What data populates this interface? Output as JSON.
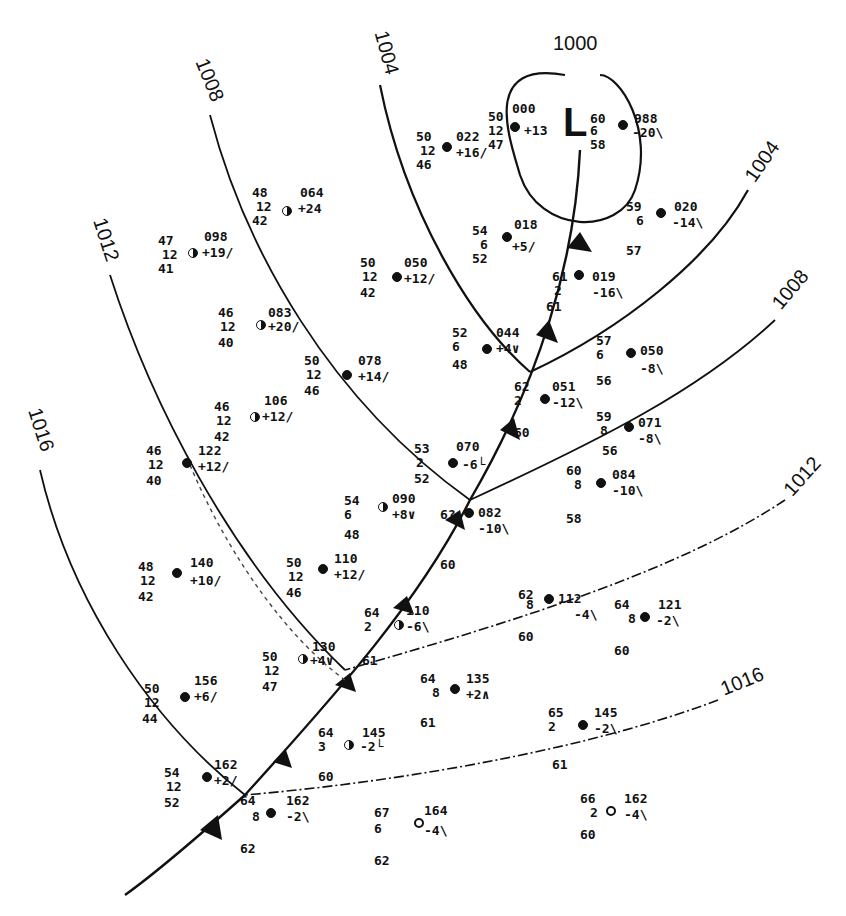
{
  "map": {
    "type": "surface weather map",
    "low_center": {
      "label": "L",
      "pressure": "1000"
    },
    "isobars": [
      {
        "id": "1000",
        "label": "1000"
      },
      {
        "id": "1004-west",
        "label": "1004"
      },
      {
        "id": "1004-east",
        "label": "1004"
      },
      {
        "id": "1008-west",
        "label": "1008"
      },
      {
        "id": "1008-east",
        "label": "1008"
      },
      {
        "id": "1012-west",
        "label": "1012"
      },
      {
        "id": "1012-east",
        "label": "1012"
      },
      {
        "id": "1016-west",
        "label": "1016"
      },
      {
        "id": "1016-east",
        "label": "1016"
      }
    ],
    "fronts": [
      {
        "type": "cold front",
        "from": "low center",
        "direction": "southwest"
      }
    ]
  },
  "stations": [
    {
      "id": "s1",
      "temp": "50",
      "vis": "12",
      "dew": "46",
      "pressure": "022",
      "tendency": "+16/"
    },
    {
      "id": "s2",
      "temp": "50",
      "vis": "12",
      "dew": "47",
      "pressure": "000",
      "tendency": "+13"
    },
    {
      "id": "s3",
      "temp": "60",
      "vis": "6",
      "dew": "58",
      "pressure": "988",
      "tendency": "-20\\"
    },
    {
      "id": "s4",
      "temp": "48",
      "vis": "12",
      "dew": "42",
      "pressure": "064",
      "tendency": "+24"
    },
    {
      "id": "s5",
      "temp": "47",
      "vis": "12",
      "dew": "41",
      "pressure": "098",
      "tendency": "+19/"
    },
    {
      "id": "s6",
      "temp": "54",
      "vis": "6",
      "dew": "52",
      "pressure": "018",
      "tendency": "+5/"
    },
    {
      "id": "s7",
      "temp": "59",
      "vis": "6",
      "dew": "57",
      "pressure": "020",
      "tendency": "-14\\"
    },
    {
      "id": "s8",
      "temp": "50",
      "vis": "12",
      "dew": "42",
      "pressure": "050",
      "tendency": "+12/"
    },
    {
      "id": "s9",
      "temp": "61",
      "vis": "2",
      "dew": "61",
      "pressure": "019",
      "tendency": "-16\\"
    },
    {
      "id": "s10",
      "temp": "46",
      "vis": "12",
      "dew": "40",
      "pressure": "083",
      "tendency": "+20/"
    },
    {
      "id": "s11",
      "temp": "52",
      "vis": "6",
      "dew": "48",
      "pressure": "044",
      "tendency": "+4∨"
    },
    {
      "id": "s12",
      "temp": "57",
      "vis": "6",
      "dew": "56",
      "pressure": "050",
      "tendency": "-8\\"
    },
    {
      "id": "s13",
      "temp": "50",
      "vis": "12",
      "dew": "46",
      "pressure": "078",
      "tendency": "+14/"
    },
    {
      "id": "s14",
      "temp": "62",
      "vis": "2",
      "dew": "60",
      "pressure": "051",
      "tendency": "-12\\"
    },
    {
      "id": "s15",
      "temp": "46",
      "vis": "12",
      "dew": "42",
      "pressure": "106",
      "tendency": "+12/"
    },
    {
      "id": "s16",
      "temp": "59",
      "vis": "8",
      "dew": "56",
      "pressure": "071",
      "tendency": "-8\\"
    },
    {
      "id": "s17",
      "temp": "46",
      "vis": "12",
      "dew": "40",
      "pressure": "122",
      "tendency": "+12/"
    },
    {
      "id": "s18",
      "temp": "53",
      "vis": "2",
      "dew": "52",
      "pressure": "070",
      "tendency": "-6└"
    },
    {
      "id": "s19",
      "temp": "60",
      "vis": "8",
      "dew": "58",
      "pressure": "084",
      "tendency": "-10\\"
    },
    {
      "id": "s20",
      "temp": "54",
      "vis": "6",
      "dew": "48",
      "pressure": "090",
      "tendency": "+8∨"
    },
    {
      "id": "s21",
      "temp": "6?",
      "vis": "",
      "dew": "60",
      "pressure": "082",
      "tendency": "-10\\"
    },
    {
      "id": "s22",
      "temp": "48",
      "vis": "12",
      "dew": "42",
      "pressure": "140",
      "tendency": "+10/"
    },
    {
      "id": "s23",
      "temp": "50",
      "vis": "12",
      "dew": "46",
      "pressure": "110",
      "tendency": "+12/"
    },
    {
      "id": "s24",
      "temp": "62",
      "vis": "8",
      "dew": "60",
      "pressure": "112",
      "tendency": "-4\\"
    },
    {
      "id": "s25",
      "temp": "64",
      "vis": "8",
      "dew": "60",
      "pressure": "121",
      "tendency": "-2\\"
    },
    {
      "id": "s26",
      "temp": "64",
      "vis": "2",
      "dew": "61",
      "pressure": "110",
      "tendency": "-6\\"
    },
    {
      "id": "s27",
      "temp": "50",
      "vis": "12",
      "dew": "47",
      "pressure": "130",
      "tendency": "+4∨"
    },
    {
      "id": "s28",
      "temp": "64",
      "vis": "8",
      "dew": "61",
      "pressure": "135",
      "tendency": "+2∧"
    },
    {
      "id": "s29",
      "temp": "50",
      "vis": "12",
      "dew": "44",
      "pressure": "156",
      "tendency": "+6/"
    },
    {
      "id": "s30",
      "temp": "64",
      "vis": "3",
      "dew": "60",
      "pressure": "145",
      "tendency": "-2└"
    },
    {
      "id": "s31",
      "temp": "65",
      "vis": "2",
      "dew": "61",
      "pressure": "145",
      "tendency": "-2\\"
    },
    {
      "id": "s32",
      "temp": "54",
      "vis": "12",
      "dew": "52",
      "pressure": "162",
      "tendency": "+2/"
    },
    {
      "id": "s33",
      "temp": "64",
      "vis": "8",
      "dew": "62",
      "pressure": "162",
      "tendency": "-2\\"
    },
    {
      "id": "s34",
      "temp": "67",
      "vis": "6",
      "dew": "62",
      "pressure": "164",
      "tendency": "-4\\"
    },
    {
      "id": "s35",
      "temp": "66",
      "vis": "2",
      "dew": "60",
      "pressure": "162",
      "tendency": "-4\\"
    }
  ]
}
